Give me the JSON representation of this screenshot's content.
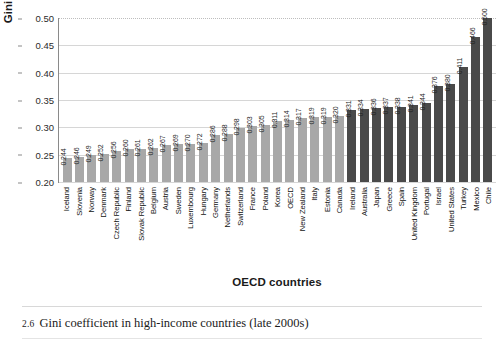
{
  "chart_data": {
    "type": "bar",
    "title": "",
    "xlabel": "OECD countries",
    "ylabel": "Gini coefficient",
    "ylim": [
      0.2,
      0.5
    ],
    "yticks": [
      "0.20",
      "0.25",
      "0.30",
      "0.35",
      "0.40",
      "0.45",
      "0.50"
    ],
    "ytick_values": [
      0.2,
      0.25,
      0.3,
      0.35,
      0.4,
      0.45,
      0.5
    ],
    "grid": true,
    "legend": "none",
    "categories": [
      "Iceland",
      "Slovenia",
      "Norway",
      "Denmark",
      "Czech Republic",
      "Finland",
      "Slovak Republic",
      "Belgium",
      "Austria",
      "Sweden",
      "Luxembourg",
      "Hungary",
      "Germany",
      "Netherlands",
      "Switzerland",
      "France",
      "Poland",
      "Korea",
      "OECD",
      "New Zealand",
      "Italy",
      "Estonia",
      "Canada",
      "Ireland",
      "Australia",
      "Japan",
      "Greece",
      "Spain",
      "United Kingdom",
      "Portugal",
      "Israel",
      "United States",
      "Turkey",
      "Mexico",
      "Chile"
    ],
    "values": [
      0.244,
      0.246,
      0.249,
      0.252,
      0.256,
      0.26,
      0.261,
      0.262,
      0.267,
      0.269,
      0.27,
      0.272,
      0.286,
      0.288,
      0.298,
      0.303,
      0.305,
      0.311,
      0.314,
      0.317,
      0.319,
      0.319,
      0.32,
      0.331,
      0.334,
      0.336,
      0.337,
      0.338,
      0.341,
      0.344,
      0.376,
      0.38,
      0.411,
      0.466,
      0.5
    ],
    "value_labels": [
      "0.244",
      "0.246",
      "0.249",
      "0.252",
      "0.256",
      "0.260",
      "0.261",
      "0.262",
      "0.267",
      "0.269",
      "0.270",
      "0.272",
      "0.286",
      "0.288",
      "0.298",
      "0.303",
      "0.305",
      "0.311",
      "0.314",
      "0.317",
      "0.319",
      "0.319",
      "0.320",
      "0.331",
      "0.334",
      "0.336",
      "0.337",
      "0.338",
      "0.341",
      "0.344",
      "0.376",
      "0.380",
      "0.411",
      "0.466",
      "0.500"
    ],
    "bar_shades": [
      "light",
      "light",
      "light",
      "light",
      "light",
      "light",
      "light",
      "light",
      "light",
      "light",
      "light",
      "light",
      "light",
      "light",
      "light",
      "light",
      "light",
      "light",
      "light",
      "light",
      "light",
      "light",
      "light",
      "dark",
      "dark",
      "dark",
      "dark",
      "dark",
      "dark",
      "dark",
      "dark",
      "dark",
      "dark",
      "dark",
      "dark"
    ],
    "colors": {
      "bar_light": "#a8a8a8",
      "bar_dark": "#4a4a4a",
      "grid": "#d6d6d6",
      "axis": "#8a8a8a",
      "text": "#1a1a1a"
    }
  },
  "caption": {
    "number": "2.6",
    "text": "Gini coefficient in high-income countries (late 2000s)"
  }
}
